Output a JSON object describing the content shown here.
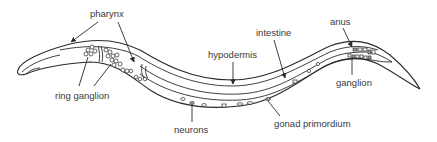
{
  "diagram": {
    "labels": {
      "pharynx": "pharynx",
      "ring_ganglion": "ring ganglion",
      "hypodermis": "hypodermis",
      "intestine": "intestine",
      "anus": "anus",
      "ganglion": "ganglion",
      "neurons": "neurons",
      "gonad_primordium": "gonad primordium"
    },
    "colors": {
      "line": "#2a2a2a",
      "text": "#3a3a3a",
      "background": "#ffffff"
    }
  }
}
